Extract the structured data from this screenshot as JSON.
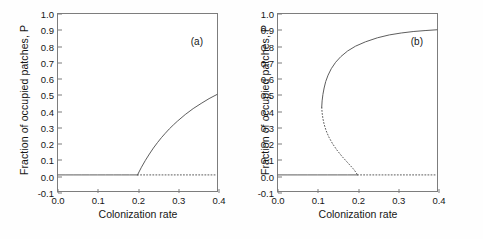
{
  "figure": {
    "background": "#ffffff",
    "line_color": "#5a5a5a",
    "axis_color": "#7d7d7d",
    "text_color": "#161616"
  },
  "axes": {
    "ylabel": "Fraction of occupied patches, P",
    "xlabel": "Colonization rate",
    "yticks": [
      "1.0",
      "0.9",
      "0.8",
      "0.7",
      "0.6",
      "0.5",
      "0.4",
      "0.3",
      "0.2",
      "0.1",
      "0.0",
      "-0.1"
    ],
    "ytick_values": [
      1.0,
      0.9,
      0.8,
      0.7,
      0.6,
      0.5,
      0.4,
      0.3,
      0.2,
      0.1,
      0.0,
      -0.1
    ],
    "xticks": [
      "0.0",
      "0.1",
      "0.2",
      "0.3",
      "0.4"
    ],
    "xtick_values": [
      0.0,
      0.1,
      0.2,
      0.3,
      0.4
    ],
    "xlim": [
      0.0,
      0.4
    ],
    "ylim": [
      -0.1,
      1.0
    ]
  },
  "panels": {
    "a": {
      "tag": "(a)"
    },
    "b": {
      "tag": "(b)"
    }
  },
  "chart_data": [
    {
      "type": "line",
      "panel": "(a)",
      "title": "",
      "xlabel": "Colonization rate",
      "ylabel": "Fraction of occupied patches, P",
      "xlim": [
        0.0,
        0.4
      ],
      "ylim": [
        -0.1,
        1.0
      ],
      "grid": false,
      "legend": null,
      "annotations": [
        "(a)"
      ],
      "bifurcation_type": "transcritical",
      "bifurcation_point": {
        "x": 0.2,
        "P": 0.0
      },
      "series": [
        {
          "name": "stable extinction branch",
          "style": "solid",
          "x": [
            0.0,
            0.02,
            0.04,
            0.06,
            0.08,
            0.1,
            0.12,
            0.14,
            0.16,
            0.18,
            0.2
          ],
          "values": [
            0.0,
            0.0,
            0.0,
            0.0,
            0.0,
            0.0,
            0.0,
            0.0,
            0.0,
            0.0,
            0.0
          ]
        },
        {
          "name": "unstable extinction branch",
          "style": "dotted",
          "x": [
            0.2,
            0.225,
            0.25,
            0.275,
            0.3,
            0.325,
            0.35,
            0.375,
            0.4
          ],
          "values": [
            0.0,
            0.0,
            0.0,
            0.0,
            0.0,
            0.0,
            0.0,
            0.0,
            0.0
          ]
        },
        {
          "name": "stable occupied branch",
          "style": "solid",
          "x": [
            0.2,
            0.205,
            0.21,
            0.22,
            0.23,
            0.24,
            0.25,
            0.26,
            0.27,
            0.28,
            0.29,
            0.3,
            0.32,
            0.34,
            0.36,
            0.38,
            0.4
          ],
          "values": [
            0.0,
            0.024,
            0.048,
            0.091,
            0.13,
            0.167,
            0.2,
            0.231,
            0.259,
            0.286,
            0.31,
            0.333,
            0.375,
            0.412,
            0.444,
            0.474,
            0.5
          ]
        }
      ]
    },
    {
      "type": "line",
      "panel": "(b)",
      "title": "",
      "xlabel": "Colonization rate",
      "ylabel": "Fraction of occupied patches, P",
      "xlim": [
        0.0,
        0.4
      ],
      "ylim": [
        -0.1,
        1.0
      ],
      "grid": false,
      "legend": null,
      "annotations": [
        "(b)"
      ],
      "bifurcation_type": "saddle-node (fold) with transcritical",
      "fold_point": {
        "x": 0.11,
        "P": 0.42
      },
      "bifurcation_point": {
        "x": 0.2,
        "P": 0.0
      },
      "series": [
        {
          "name": "stable extinction branch",
          "style": "solid",
          "x": [
            0.0,
            0.025,
            0.05,
            0.075,
            0.1,
            0.125,
            0.15,
            0.175,
            0.2
          ],
          "values": [
            0.0,
            0.0,
            0.0,
            0.0,
            0.0,
            0.0,
            0.0,
            0.0,
            0.0
          ]
        },
        {
          "name": "unstable extinction branch",
          "style": "dotted",
          "x": [
            0.2,
            0.225,
            0.25,
            0.275,
            0.3,
            0.325,
            0.35,
            0.375,
            0.4
          ],
          "values": [
            0.0,
            0.0,
            0.0,
            0.0,
            0.0,
            0.0,
            0.0,
            0.0,
            0.0
          ]
        },
        {
          "name": "stable upper branch",
          "style": "solid",
          "x": [
            0.11,
            0.111,
            0.113,
            0.116,
            0.12,
            0.126,
            0.134,
            0.145,
            0.158,
            0.175,
            0.195,
            0.22,
            0.25,
            0.28,
            0.31,
            0.34,
            0.37,
            0.4
          ],
          "values": [
            0.42,
            0.46,
            0.5,
            0.54,
            0.58,
            0.62,
            0.66,
            0.7,
            0.735,
            0.77,
            0.8,
            0.827,
            0.852,
            0.87,
            0.882,
            0.891,
            0.897,
            0.902
          ]
        },
        {
          "name": "unstable middle branch",
          "style": "dotted",
          "x": [
            0.11,
            0.111,
            0.113,
            0.116,
            0.121,
            0.128,
            0.137,
            0.148,
            0.161,
            0.172,
            0.182,
            0.19,
            0.196,
            0.2
          ],
          "values": [
            0.42,
            0.385,
            0.35,
            0.315,
            0.275,
            0.235,
            0.195,
            0.155,
            0.115,
            0.085,
            0.058,
            0.036,
            0.016,
            0.0
          ]
        }
      ]
    }
  ]
}
